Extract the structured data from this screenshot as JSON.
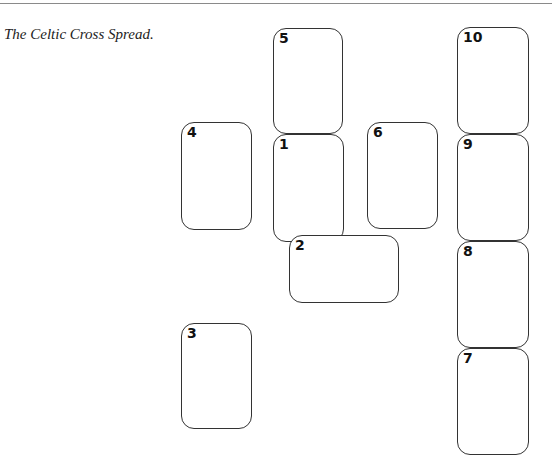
{
  "document": {
    "header_fragment": "· · ·",
    "caption": "The Celtic Cross Spread."
  },
  "spread": {
    "name": "Celtic Cross",
    "cards": [
      {
        "number": "1",
        "orientation": "vertical"
      },
      {
        "number": "2",
        "orientation": "horizontal"
      },
      {
        "number": "3",
        "orientation": "vertical"
      },
      {
        "number": "4",
        "orientation": "vertical"
      },
      {
        "number": "5",
        "orientation": "vertical"
      },
      {
        "number": "6",
        "orientation": "vertical"
      },
      {
        "number": "7",
        "orientation": "vertical"
      },
      {
        "number": "8",
        "orientation": "vertical"
      },
      {
        "number": "9",
        "orientation": "vertical"
      },
      {
        "number": "10",
        "orientation": "vertical"
      }
    ]
  }
}
